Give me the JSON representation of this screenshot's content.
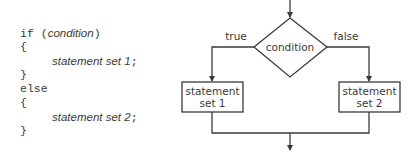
{
  "code": {
    "if_keyword": "if",
    "condition": "condition",
    "open_brace_1": "{",
    "statement1": "statement set 1",
    "semicolon": ";",
    "close_brace_1": "}",
    "else_keyword": "else",
    "open_brace_2": "{",
    "statement2": "statement set 2",
    "close_brace_2": "}"
  },
  "flowchart": {
    "decision": "condition",
    "true_label": "true",
    "false_label": "false",
    "box1_line1": "statement",
    "box1_line2": "set 1",
    "box2_line1": "statement",
    "box2_line2": "set 2"
  },
  "colors": {
    "stroke": "#3a3a3a",
    "text": "#3a3a3a",
    "background": "#ffffff"
  }
}
